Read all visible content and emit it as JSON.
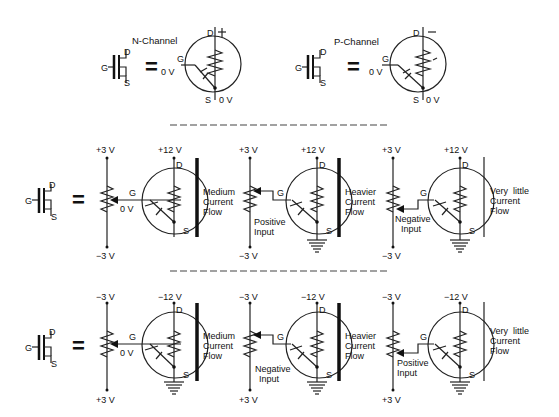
{
  "top": {
    "n_channel": {
      "title": "N-Channel",
      "gate": "G",
      "drain": "D",
      "source": "S",
      "gate_v": "0 V",
      "drain_sign": "+",
      "source_v": "0 V"
    },
    "p_channel": {
      "title": "P-Channel",
      "gate": "G",
      "drain": "D",
      "source": "S",
      "gate_v": "0 V",
      "drain_sign": "–",
      "source_v": "0 V"
    },
    "equals": "="
  },
  "row1": {
    "symbol": {
      "gate": "G",
      "drain": "D",
      "source": "S"
    },
    "equals": "=",
    "circuits": [
      {
        "pot_top": "+3 V",
        "pot_bottom": "−3 V",
        "drain_v": "+12 V",
        "gate": "G",
        "drain": "D",
        "source": "S",
        "gate_v": "0 V",
        "input_label_1": "",
        "input_label_2": "",
        "flow_1": "Medium",
        "flow_2": "Current",
        "flow_3": "Flow"
      },
      {
        "pot_top": "+3 V",
        "pot_bottom": "−3 V",
        "drain_v": "+12 V",
        "gate": "G",
        "drain": "D",
        "source": "S",
        "gate_v": "",
        "input_label_1": "Positive",
        "input_label_2": "Input",
        "flow_1": "Heavier",
        "flow_2": "Current",
        "flow_3": "Flow"
      },
      {
        "pot_top": "+3 V",
        "pot_bottom": "−3 V",
        "drain_v": "+12 V",
        "gate": "G",
        "drain": "D",
        "source": "S",
        "gate_v": "",
        "input_label_1": "Negative",
        "input_label_2": "Input",
        "flow_1": "Very  little",
        "flow_2": "Current",
        "flow_3": "Flow"
      }
    ]
  },
  "row2": {
    "symbol": {
      "gate": "G",
      "drain": "D",
      "source": "S"
    },
    "equals": "=",
    "circuits": [
      {
        "pot_top": "−3 V",
        "pot_bottom": "+3 V",
        "drain_v": "−12 V",
        "gate": "G",
        "drain": "D",
        "source": "S",
        "gate_v": "0 V",
        "input_label_1": "",
        "input_label_2": "",
        "flow_1": "Medium",
        "flow_2": "Current",
        "flow_3": "Flow"
      },
      {
        "pot_top": "−3 V",
        "pot_bottom": "+3 V",
        "drain_v": "−12 V",
        "gate": "G",
        "drain": "D",
        "source": "S",
        "gate_v": "",
        "input_label_1": "Negative",
        "input_label_2": "Input",
        "flow_1": "Heavier",
        "flow_2": "Current",
        "flow_3": "Flow"
      },
      {
        "pot_top": "−3 V",
        "pot_bottom": "+3 V",
        "drain_v": "−12 V",
        "gate": "G",
        "drain": "D",
        "source": "S",
        "gate_v": "",
        "input_label_1": "Positive",
        "input_label_2": "Input",
        "flow_1": "Very  little",
        "flow_2": "Current",
        "flow_3": "Flow"
      }
    ]
  }
}
